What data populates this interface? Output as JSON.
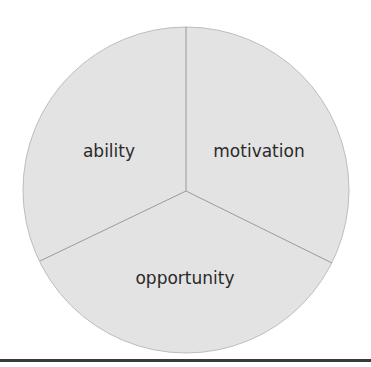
{
  "diagram": {
    "type": "three-segment circle",
    "segments": [
      {
        "label": "ability"
      },
      {
        "label": "motivation"
      },
      {
        "label": "opportunity"
      }
    ],
    "colors": {
      "fill": "#e3e3e3",
      "stroke": "#bdbdbd",
      "divider": "#9a9a9a",
      "text": "#2a2a2a",
      "baseline": "#3a3a3a"
    }
  }
}
